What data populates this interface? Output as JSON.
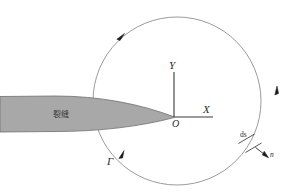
{
  "figure": {
    "background_color": "#ffffff"
  },
  "crack": {
    "label": "裂缝",
    "fill_color": "#a8a8a8",
    "stroke_color": "#6e6e6e"
  },
  "axes": {
    "x_label": "X",
    "y_label": "Y",
    "origin_label": "O",
    "color": "#3a3a3a"
  },
  "contour": {
    "label": "Γ",
    "color": "#8a8a8a",
    "direction": "counterclockwise"
  },
  "element": {
    "arc_length_label": "ds",
    "normal_label": "n",
    "color": "#2a2a2a"
  },
  "arrowheads": [
    {
      "name": "contour-arrow-top-left"
    },
    {
      "name": "contour-arrow-right"
    },
    {
      "name": "contour-arrow-bottom-left"
    },
    {
      "name": "normal-arrow"
    }
  ]
}
